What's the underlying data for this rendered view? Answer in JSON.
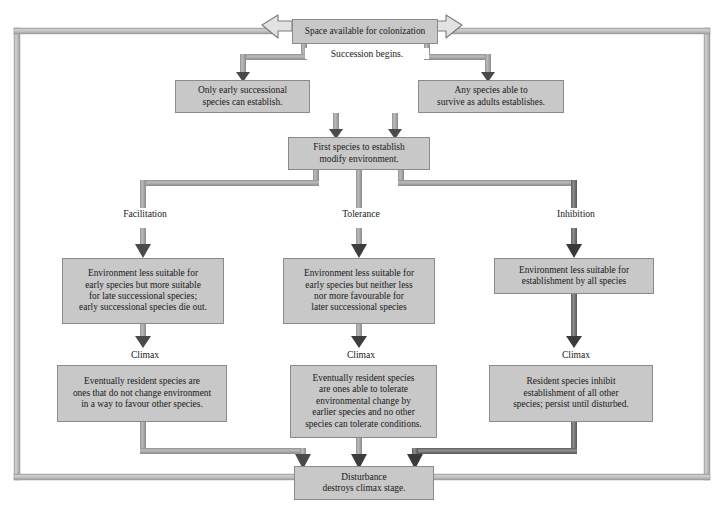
{
  "diagram": {
    "colors": {
      "box_fill": "#c8c8c8",
      "box_border": "#8a8a8a",
      "connector_light": "#b0b0b0",
      "connector_mid": "#9a9a9a",
      "connector_dark": "#6e6e6e",
      "text": "#1a1a1a",
      "background": "#ffffff"
    },
    "boxes": {
      "space_available": "Space available for colonization",
      "early_successional": "Only early successional\nspecies can establish.",
      "any_species": "Any species able to\nsurvive as adults establishes.",
      "first_species": "First species to establish\nmodify environment.",
      "facilitation_effect": "Environment less suitable for\nearly species but more suitable\nfor late successional species;\nearly successional species die out.",
      "tolerance_effect": "Environment less suitable for\nearly species but neither less\nnor more favourable for\nlater successional species",
      "inhibition_effect": "Environment less suitable for\nestablishment by all species",
      "facilitation_climax": "Eventually resident species are\nones that do not change environment\nin a way to favour other species.",
      "tolerance_climax": "Eventually resident species\nare ones able to tolerate\nenvironmental change by\nearlier species and no other\nspecies can tolerate conditions.",
      "inhibition_climax": "Resident species inhibit\nestablishment of all other\nspecies; persist until disturbed.",
      "disturbance": "Disturbance\ndestroys climax stage."
    },
    "labels": {
      "succession_begins": "Succession begins.",
      "facilitation": "Facilitation",
      "tolerance": "Tolerance",
      "inhibition": "Inhibition",
      "climax_left": "Climax",
      "climax_middle": "Climax",
      "climax_right": "Climax"
    }
  }
}
